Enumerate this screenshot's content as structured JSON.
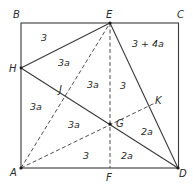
{
  "points": {
    "A": {
      "label": "A",
      "x": 21,
      "y": 168
    },
    "B": {
      "label": "B",
      "x": 21,
      "y": 23
    },
    "C": {
      "label": "C",
      "x": 179,
      "y": 23
    },
    "D": {
      "label": "D",
      "x": 178,
      "y": 168
    },
    "E": {
      "label": "E",
      "x": 110,
      "y": 23
    },
    "F": {
      "label": "F",
      "x": 110,
      "y": 168
    },
    "H": {
      "label": "H",
      "x": 21,
      "y": 68
    },
    "J": {
      "label": "J",
      "x": 65,
      "y": 96
    },
    "G": {
      "label": "G",
      "x": 110,
      "y": 124
    },
    "K": {
      "label": "K",
      "x": 155,
      "y": 103
    }
  },
  "regions": [
    {
      "label": "3",
      "x": 44,
      "y": 41
    },
    {
      "label": "3 + 4a",
      "x": 148,
      "y": 47
    },
    {
      "label": "3a",
      "x": 64,
      "y": 66
    },
    {
      "label": "3a",
      "x": 93,
      "y": 88
    },
    {
      "label": "3",
      "x": 123,
      "y": 89
    },
    {
      "label": "3a",
      "x": 36,
      "y": 110
    },
    {
      "label": "3a",
      "x": 74,
      "y": 128
    },
    {
      "label": "3",
      "x": 86,
      "y": 159
    },
    {
      "label": "2a",
      "x": 147,
      "y": 135
    },
    {
      "label": "2a",
      "x": 127,
      "y": 159
    }
  ]
}
